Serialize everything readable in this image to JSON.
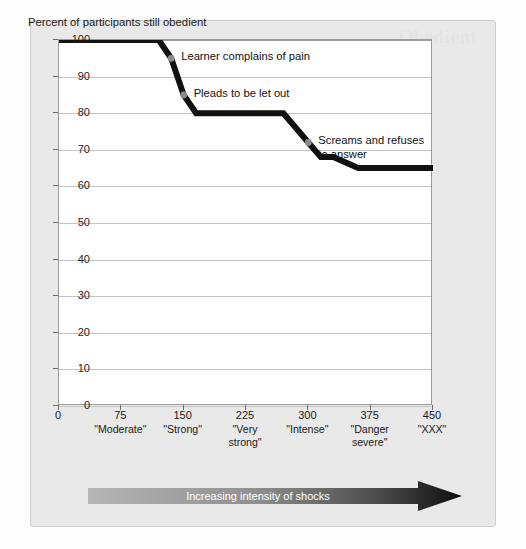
{
  "panel": {
    "watermark": "Obedient"
  },
  "chart_data": {
    "type": "line",
    "title": "",
    "ylabel": "Percent of participants still obedient",
    "xlabel": "Increasing intensity of shocks",
    "ylim": [
      0,
      100
    ],
    "xlim": [
      0,
      450
    ],
    "yticks": [
      0,
      10,
      20,
      30,
      40,
      50,
      60,
      70,
      80,
      90,
      100
    ],
    "xticks": [
      0,
      75,
      150,
      225,
      300,
      375,
      450
    ],
    "xtick_labels": [
      "0",
      "75",
      "150",
      "225",
      "300",
      "375",
      "450"
    ],
    "xtick_sublabels": [
      "",
      "\"Moderate\"",
      "\"Strong\"",
      "\"Very\nstrong\"",
      "\"Intense\"",
      "\"Danger\nsevere\"",
      "\"XXX\""
    ],
    "grid": true,
    "legend": "none",
    "line_color": "#111111",
    "marker_color": "#8c8c8c",
    "series": [
      {
        "name": "Percent of participants still obedient",
        "points": [
          {
            "x": 0,
            "y": 100
          },
          {
            "x": 120,
            "y": 100
          },
          {
            "x": 135,
            "y": 95
          },
          {
            "x": 150,
            "y": 85
          },
          {
            "x": 165,
            "y": 80
          },
          {
            "x": 270,
            "y": 80
          },
          {
            "x": 300,
            "y": 72
          },
          {
            "x": 315,
            "y": 68
          },
          {
            "x": 330,
            "y": 68
          },
          {
            "x": 360,
            "y": 65
          },
          {
            "x": 450,
            "y": 65
          }
        ]
      }
    ],
    "markers": [
      {
        "x": 135,
        "y": 95,
        "label": "Learner complains of pain"
      },
      {
        "x": 150,
        "y": 85,
        "label": "Pleads to be let out"
      },
      {
        "x": 300,
        "y": 72,
        "label": "Screams and refuses\nto answer"
      }
    ],
    "annotations": [
      {
        "text": "Learner complains of pain",
        "anchor_x": 135,
        "anchor_y": 95
      },
      {
        "text": "Pleads to be let out",
        "anchor_x": 150,
        "anchor_y": 85
      },
      {
        "text": "Screams and refuses\nto answer",
        "anchor_x": 300,
        "anchor_y": 72
      }
    ]
  }
}
